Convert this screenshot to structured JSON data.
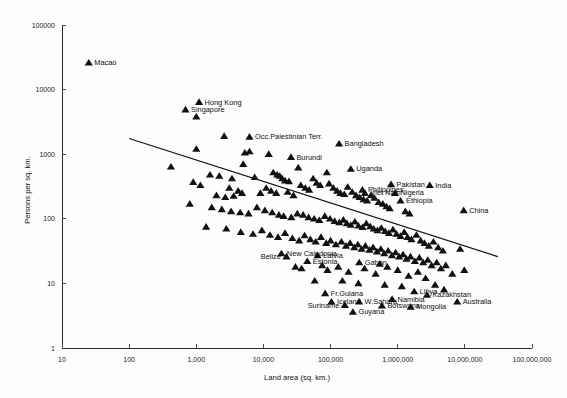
{
  "chart_data": {
    "type": "scatter",
    "title": "",
    "xlabel": "Land area (sq. km.)",
    "ylabel": "Persons per sq. km.",
    "xscale": "log",
    "yscale": "log",
    "xlim": [
      10,
      100000000
    ],
    "ylim": [
      1,
      100000
    ],
    "grid": false,
    "legend": "none",
    "xticklabels": [
      "10",
      "100",
      "1,000",
      "10,000",
      "100,000",
      "1,000,000",
      "10,000,000",
      "100,000,000"
    ],
    "xtickvalues": [
      10,
      100,
      1000,
      10000,
      100000,
      1000000,
      10000000,
      100000000
    ],
    "yticklabels": [
      "1",
      "10",
      "100",
      "1000",
      "10000",
      "100000"
    ],
    "ytickvalues": [
      1,
      10,
      100,
      1000,
      10000,
      100000
    ],
    "marker": "triangle",
    "marker_color": "#111111",
    "trendline": {
      "type": "log-log linear fit",
      "x_start": 100,
      "y_start": 1750,
      "x_end": 31000000,
      "y_end": 26
    },
    "labeled_points": [
      {
        "name": "Macao",
        "x": 25,
        "y": 26000,
        "label_side": "right"
      },
      {
        "name": "Hong Kong",
        "x": 1100,
        "y": 6400,
        "label_side": "right"
      },
      {
        "name": "Singapore",
        "x": 690,
        "y": 4900,
        "label_side": "right"
      },
      {
        "name": "Occ.Palestinian Terr.",
        "x": 6200,
        "y": 1850,
        "label_side": "right"
      },
      {
        "name": "Bangladesh",
        "x": 134000,
        "y": 1450,
        "label_side": "right"
      },
      {
        "name": "Burundi",
        "x": 25700,
        "y": 900,
        "label_side": "right"
      },
      {
        "name": "Uganda",
        "x": 200000,
        "y": 590,
        "label_side": "right"
      },
      {
        "name": "Pakistan",
        "x": 796000,
        "y": 340,
        "label_side": "right"
      },
      {
        "name": "India",
        "x": 3000000,
        "y": 330,
        "label_side": "right"
      },
      {
        "name": "Philippines",
        "x": 298000,
        "y": 280,
        "label_side": "right"
      },
      {
        "name": "Viet Nam",
        "x": 325000,
        "y": 250,
        "label_side": "right"
      },
      {
        "name": "Nigeria",
        "x": 910000,
        "y": 250,
        "label_side": "right"
      },
      {
        "name": "Ethiopia",
        "x": 1100000,
        "y": 190,
        "label_side": "right"
      },
      {
        "name": "China",
        "x": 9600000,
        "y": 135,
        "label_side": "right"
      },
      {
        "name": "New Caledonia",
        "x": 18500,
        "y": 29,
        "label_side": "right"
      },
      {
        "name": "Belize",
        "x": 22000,
        "y": 26,
        "label_side": "left"
      },
      {
        "name": "Latvia",
        "x": 64000,
        "y": 27,
        "label_side": "right"
      },
      {
        "name": "Estonia",
        "x": 45000,
        "y": 22,
        "label_side": "right"
      },
      {
        "name": "Gabon",
        "x": 267000,
        "y": 21,
        "label_side": "right"
      },
      {
        "name": "Fr.Guiana",
        "x": 83000,
        "y": 7.0,
        "label_side": "right"
      },
      {
        "name": "Iceland",
        "x": 103000,
        "y": 5.2,
        "label_side": "right"
      },
      {
        "name": "W.Sahara",
        "x": 266000,
        "y": 5.2,
        "label_side": "right"
      },
      {
        "name": "Suriname",
        "x": 163000,
        "y": 4.6,
        "label_side": "left"
      },
      {
        "name": "Guyana",
        "x": 215000,
        "y": 3.6,
        "label_side": "right"
      },
      {
        "name": "Namibia",
        "x": 824000,
        "y": 5.7,
        "label_side": "right"
      },
      {
        "name": "Botswana",
        "x": 582000,
        "y": 4.5,
        "label_side": "right"
      },
      {
        "name": "Libya",
        "x": 1760000,
        "y": 7.5,
        "label_side": "right"
      },
      {
        "name": "Mongolia",
        "x": 1560000,
        "y": 4.3,
        "label_side": "right"
      },
      {
        "name": "Kazakhstan",
        "x": 2720000,
        "y": 6.6,
        "label_side": "right"
      },
      {
        "name": "Australia",
        "x": 7690000,
        "y": 5.2,
        "label_side": "right"
      }
    ],
    "unlabeled_points": [
      {
        "x": 1000,
        "y": 3800
      },
      {
        "x": 1000,
        "y": 1200
      },
      {
        "x": 2600,
        "y": 1900
      },
      {
        "x": 420,
        "y": 640
      },
      {
        "x": 1600,
        "y": 480
      },
      {
        "x": 2200,
        "y": 460
      },
      {
        "x": 900,
        "y": 370
      },
      {
        "x": 1150,
        "y": 330
      },
      {
        "x": 3400,
        "y": 420
      },
      {
        "x": 3100,
        "y": 300
      },
      {
        "x": 5300,
        "y": 1050
      },
      {
        "x": 5000,
        "y": 700
      },
      {
        "x": 4200,
        "y": 270
      },
      {
        "x": 4800,
        "y": 250
      },
      {
        "x": 7400,
        "y": 440
      },
      {
        "x": 9000,
        "y": 250
      },
      {
        "x": 2000,
        "y": 230
      },
      {
        "x": 2700,
        "y": 215
      },
      {
        "x": 3600,
        "y": 225
      },
      {
        "x": 6200,
        "y": 1100
      },
      {
        "x": 12000,
        "y": 1000
      },
      {
        "x": 14000,
        "y": 520
      },
      {
        "x": 16000,
        "y": 480
      },
      {
        "x": 17500,
        "y": 460
      },
      {
        "x": 19000,
        "y": 420
      },
      {
        "x": 21000,
        "y": 390
      },
      {
        "x": 24000,
        "y": 380
      },
      {
        "x": 11000,
        "y": 300
      },
      {
        "x": 13000,
        "y": 270
      },
      {
        "x": 15500,
        "y": 250
      },
      {
        "x": 23000,
        "y": 260
      },
      {
        "x": 28000,
        "y": 230
      },
      {
        "x": 33000,
        "y": 620
      },
      {
        "x": 36000,
        "y": 330
      },
      {
        "x": 42000,
        "y": 300
      },
      {
        "x": 48000,
        "y": 280
      },
      {
        "x": 55000,
        "y": 420
      },
      {
        "x": 62000,
        "y": 360
      },
      {
        "x": 70000,
        "y": 330
      },
      {
        "x": 88000,
        "y": 520
      },
      {
        "x": 95000,
        "y": 350
      },
      {
        "x": 110000,
        "y": 300
      },
      {
        "x": 125000,
        "y": 270
      },
      {
        "x": 140000,
        "y": 250
      },
      {
        "x": 160000,
        "y": 240
      },
      {
        "x": 180000,
        "y": 310
      },
      {
        "x": 210000,
        "y": 260
      },
      {
        "x": 240000,
        "y": 230
      },
      {
        "x": 270000,
        "y": 215
      },
      {
        "x": 310000,
        "y": 200
      },
      {
        "x": 350000,
        "y": 190
      },
      {
        "x": 400000,
        "y": 230
      },
      {
        "x": 450000,
        "y": 210
      },
      {
        "x": 520000,
        "y": 180
      },
      {
        "x": 600000,
        "y": 170
      },
      {
        "x": 680000,
        "y": 155
      },
      {
        "x": 760000,
        "y": 145
      },
      {
        "x": 1300000,
        "y": 130
      },
      {
        "x": 1500000,
        "y": 120
      },
      {
        "x": 800,
        "y": 170
      },
      {
        "x": 1700,
        "y": 150
      },
      {
        "x": 2400,
        "y": 140
      },
      {
        "x": 3300,
        "y": 130
      },
      {
        "x": 4500,
        "y": 125
      },
      {
        "x": 6000,
        "y": 120
      },
      {
        "x": 8000,
        "y": 150
      },
      {
        "x": 10500,
        "y": 135
      },
      {
        "x": 13500,
        "y": 125
      },
      {
        "x": 17000,
        "y": 115
      },
      {
        "x": 20000,
        "y": 110
      },
      {
        "x": 26000,
        "y": 105
      },
      {
        "x": 32000,
        "y": 120
      },
      {
        "x": 39000,
        "y": 115
      },
      {
        "x": 47000,
        "y": 105
      },
      {
        "x": 57000,
        "y": 100
      },
      {
        "x": 68000,
        "y": 95
      },
      {
        "x": 82000,
        "y": 110
      },
      {
        "x": 98000,
        "y": 100
      },
      {
        "x": 115000,
        "y": 92
      },
      {
        "x": 135000,
        "y": 88
      },
      {
        "x": 155000,
        "y": 96
      },
      {
        "x": 175000,
        "y": 85
      },
      {
        "x": 200000,
        "y": 80
      },
      {
        "x": 230000,
        "y": 90
      },
      {
        "x": 260000,
        "y": 78
      },
      {
        "x": 300000,
        "y": 74
      },
      {
        "x": 340000,
        "y": 85
      },
      {
        "x": 390000,
        "y": 76
      },
      {
        "x": 440000,
        "y": 70
      },
      {
        "x": 500000,
        "y": 66
      },
      {
        "x": 570000,
        "y": 72
      },
      {
        "x": 650000,
        "y": 64
      },
      {
        "x": 740000,
        "y": 60
      },
      {
        "x": 850000,
        "y": 68
      },
      {
        "x": 960000,
        "y": 58
      },
      {
        "x": 1100000,
        "y": 54
      },
      {
        "x": 1250000,
        "y": 62
      },
      {
        "x": 1400000,
        "y": 52
      },
      {
        "x": 1600000,
        "y": 48
      },
      {
        "x": 1900000,
        "y": 56
      },
      {
        "x": 2200000,
        "y": 46
      },
      {
        "x": 2500000,
        "y": 42
      },
      {
        "x": 2900000,
        "y": 38
      },
      {
        "x": 3400000,
        "y": 44
      },
      {
        "x": 4000000,
        "y": 36
      },
      {
        "x": 4700000,
        "y": 32
      },
      {
        "x": 1400,
        "y": 75
      },
      {
        "x": 2800,
        "y": 70
      },
      {
        "x": 4600,
        "y": 62
      },
      {
        "x": 7000,
        "y": 58
      },
      {
        "x": 9500,
        "y": 66
      },
      {
        "x": 12500,
        "y": 56
      },
      {
        "x": 16500,
        "y": 52
      },
      {
        "x": 21000,
        "y": 60
      },
      {
        "x": 27000,
        "y": 50
      },
      {
        "x": 34000,
        "y": 46
      },
      {
        "x": 41000,
        "y": 55
      },
      {
        "x": 50000,
        "y": 48
      },
      {
        "x": 60000,
        "y": 44
      },
      {
        "x": 72000,
        "y": 52
      },
      {
        "x": 86000,
        "y": 42
      },
      {
        "x": 100000,
        "y": 46
      },
      {
        "x": 120000,
        "y": 40
      },
      {
        "x": 145000,
        "y": 44
      },
      {
        "x": 170000,
        "y": 38
      },
      {
        "x": 195000,
        "y": 42
      },
      {
        "x": 225000,
        "y": 36
      },
      {
        "x": 255000,
        "y": 40
      },
      {
        "x": 290000,
        "y": 34
      },
      {
        "x": 330000,
        "y": 38
      },
      {
        "x": 380000,
        "y": 33
      },
      {
        "x": 430000,
        "y": 36
      },
      {
        "x": 490000,
        "y": 31
      },
      {
        "x": 560000,
        "y": 34
      },
      {
        "x": 630000,
        "y": 29
      },
      {
        "x": 720000,
        "y": 32
      },
      {
        "x": 820000,
        "y": 27
      },
      {
        "x": 930000,
        "y": 30
      },
      {
        "x": 1050000,
        "y": 26
      },
      {
        "x": 1200000,
        "y": 28
      },
      {
        "x": 1350000,
        "y": 24
      },
      {
        "x": 1550000,
        "y": 26
      },
      {
        "x": 1800000,
        "y": 22
      },
      {
        "x": 2100000,
        "y": 25
      },
      {
        "x": 2400000,
        "y": 21
      },
      {
        "x": 2800000,
        "y": 23
      },
      {
        "x": 3200000,
        "y": 19
      },
      {
        "x": 3800000,
        "y": 21
      },
      {
        "x": 4400000,
        "y": 17
      },
      {
        "x": 5200000,
        "y": 19
      },
      {
        "x": 6500000,
        "y": 14
      },
      {
        "x": 8500000,
        "y": 34
      },
      {
        "x": 9800000,
        "y": 16
      },
      {
        "x": 30000,
        "y": 18
      },
      {
        "x": 37000,
        "y": 17
      },
      {
        "x": 75000,
        "y": 19
      },
      {
        "x": 90000,
        "y": 16
      },
      {
        "x": 130000,
        "y": 18
      },
      {
        "x": 185000,
        "y": 15
      },
      {
        "x": 320000,
        "y": 17
      },
      {
        "x": 470000,
        "y": 14
      },
      {
        "x": 540000,
        "y": 20
      },
      {
        "x": 700000,
        "y": 18
      },
      {
        "x": 1000000,
        "y": 16
      },
      {
        "x": 1450000,
        "y": 13
      },
      {
        "x": 2000000,
        "y": 15
      },
      {
        "x": 2600000,
        "y": 12
      },
      {
        "x": 58000,
        "y": 11
      },
      {
        "x": 150000,
        "y": 11
      },
      {
        "x": 260000,
        "y": 10
      },
      {
        "x": 640000,
        "y": 9.5
      },
      {
        "x": 1150000,
        "y": 9.0
      },
      {
        "x": 3600000,
        "y": 9.5
      },
      {
        "x": 4900000,
        "y": 8.0
      }
    ]
  },
  "axes": {
    "x_title": "Land area (sq. km.)",
    "y_title": "Persons per sq. km."
  }
}
